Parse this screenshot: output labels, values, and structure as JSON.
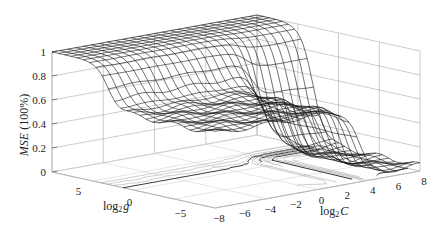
{
  "chart_data": {
    "type": "surface",
    "title": "",
    "xlabel": "log2 C",
    "ylabel": "log2 g",
    "zlabel": "MSE (100%)",
    "x_ticks": [
      -8,
      -6,
      -4,
      -2,
      0,
      2,
      4,
      6,
      8
    ],
    "y_ticks": [
      5,
      0,
      -5
    ],
    "z_ticks": [
      0,
      0.2,
      0.4,
      0.6,
      0.8,
      1
    ],
    "xlim": [
      -8,
      8
    ],
    "ylim": [
      -8,
      8
    ],
    "zlim": [
      0,
      1
    ],
    "grid": true,
    "legend": null,
    "surface_samples": {
      "log2g": [
        8,
        4,
        0,
        -4,
        -8
      ],
      "log2C": [
        -8,
        -4,
        0,
        4,
        8
      ],
      "mse": [
        [
          1.0,
          1.0,
          1.0,
          0.95,
          0.9
        ],
        [
          0.85,
          0.8,
          0.75,
          0.7,
          0.3
        ],
        [
          0.62,
          0.6,
          0.6,
          0.55,
          0.1
        ],
        [
          0.6,
          0.6,
          0.58,
          0.2,
          0.05
        ],
        [
          0.6,
          0.58,
          0.5,
          0.1,
          0.02
        ]
      ]
    }
  },
  "labels": {
    "zlabel_italic": "MSE",
    "zlabel_unit": " (100%)",
    "glabel_prefix": "log",
    "glabel_sub": "2",
    "glabel_var": "g",
    "clabel_prefix": "log",
    "clabel_sub": "2",
    "clabel_var": "C"
  }
}
